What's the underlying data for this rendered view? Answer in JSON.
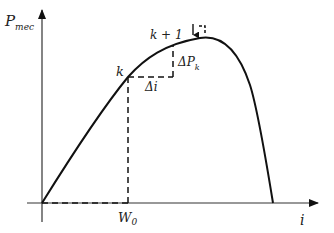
{
  "diagram": {
    "y_axis_label": "P",
    "y_axis_sub": "mec",
    "x_axis_label": "i",
    "point_k": "k",
    "point_k1": "k + 1",
    "delta_i": "Δi",
    "delta_p": "ΔP",
    "delta_p_sub": "k",
    "w0": "W",
    "w0_sub": "0",
    "colors": {
      "line": "#111111",
      "axis": "#333333",
      "background": "#ffffff"
    }
  }
}
